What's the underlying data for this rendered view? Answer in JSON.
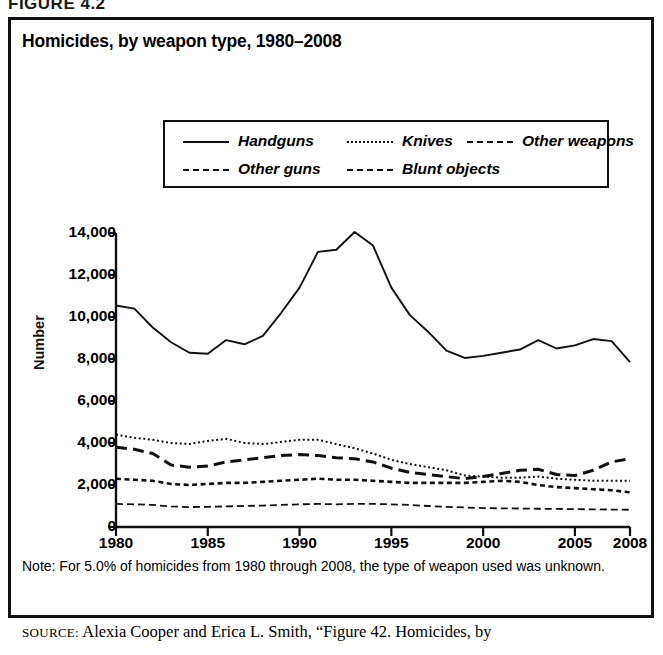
{
  "figure": {
    "header": "FIGURE 4.2",
    "title": "Homicides, by weapon type, 1980–2008",
    "note": "Note: For 5.0% of homicides from 1980 through 2008, the type of weapon used was unknown.",
    "source_prefix": "SOURCE:",
    "source_text": " Alexia Cooper and Erica L. Smith, “Figure 42. Homicides, by"
  },
  "legend": {
    "items": [
      {
        "label": "Handguns",
        "style": "solid",
        "name": "legend-handguns"
      },
      {
        "label": "Knives",
        "style": "dot",
        "name": "legend-knives"
      },
      {
        "label": "Other weapons",
        "style": "dash-sm",
        "name": "legend-other-weapons"
      },
      {
        "label": "Other guns",
        "style": "dash-lg",
        "name": "legend-other-guns"
      },
      {
        "label": "Blunt objects",
        "style": "dashdot",
        "name": "legend-blunt-objects"
      }
    ]
  },
  "chart_data": {
    "type": "line",
    "title": "Homicides, by weapon type, 1980–2008",
    "xlabel": "",
    "ylabel": "Number",
    "xlim": [
      1980,
      2008
    ],
    "ylim": [
      0,
      14000
    ],
    "ytick_values": [
      0,
      2000,
      4000,
      6000,
      8000,
      10000,
      12000,
      14000
    ],
    "ytick_labels": [
      "0",
      "2,000",
      "4,000",
      "6,000",
      "8,000",
      "10,000",
      "12,000",
      "14,000"
    ],
    "xtick_values": [
      1980,
      1985,
      1990,
      1995,
      2000,
      2005,
      2008
    ],
    "xtick_labels": [
      "1980",
      "1985",
      "1990",
      "1995",
      "2000",
      "2005",
      "2008"
    ],
    "grid": false,
    "legend_position": "top-center",
    "x": [
      1980,
      1981,
      1982,
      1983,
      1984,
      1985,
      1986,
      1987,
      1988,
      1989,
      1990,
      1991,
      1992,
      1993,
      1994,
      1995,
      1996,
      1997,
      1998,
      1999,
      2000,
      2001,
      2002,
      2003,
      2004,
      2005,
      2006,
      2007,
      2008
    ],
    "series": [
      {
        "name": "Handguns",
        "line_style": "solid",
        "values": [
          10550,
          10400,
          9500,
          8800,
          8300,
          8250,
          8900,
          8700,
          9100,
          10200,
          11400,
          13100,
          13200,
          14050,
          13400,
          11400,
          10100,
          9300,
          8400,
          8050,
          8150,
          8300,
          8450,
          8900,
          8500,
          8650,
          8950,
          8850,
          7850
        ]
      },
      {
        "name": "Other guns",
        "line_style": "long-dash",
        "values": [
          3800,
          3700,
          3500,
          2950,
          2850,
          2900,
          3100,
          3200,
          3300,
          3400,
          3450,
          3400,
          3300,
          3250,
          3100,
          2800,
          2600,
          2500,
          2400,
          2300,
          2400,
          2550,
          2700,
          2750,
          2500,
          2450,
          2700,
          3100,
          3250
        ]
      },
      {
        "name": "Knives",
        "line_style": "dotted",
        "values": [
          4400,
          4250,
          4150,
          4000,
          3950,
          4100,
          4200,
          4000,
          3950,
          4050,
          4150,
          4150,
          3950,
          3750,
          3500,
          3200,
          3000,
          2850,
          2700,
          2450,
          2400,
          2350,
          2350,
          2400,
          2300,
          2250,
          2200,
          2200,
          2200
        ]
      },
      {
        "name": "Other weapons",
        "line_style": "short-dash",
        "values": [
          2300,
          2250,
          2200,
          2050,
          2000,
          2050,
          2100,
          2100,
          2150,
          2200,
          2250,
          2300,
          2250,
          2250,
          2200,
          2150,
          2100,
          2100,
          2100,
          2100,
          2150,
          2200,
          2150,
          2000,
          1900,
          1850,
          1800,
          1750,
          1650
        ]
      },
      {
        "name": "Blunt objects",
        "line_style": "dash-dot",
        "values": [
          1100,
          1080,
          1050,
          980,
          950,
          960,
          980,
          1000,
          1020,
          1050,
          1080,
          1100,
          1080,
          1100,
          1100,
          1080,
          1050,
          1000,
          960,
          930,
          900,
          890,
          880,
          870,
          860,
          850,
          840,
          830,
          820
        ]
      }
    ]
  }
}
